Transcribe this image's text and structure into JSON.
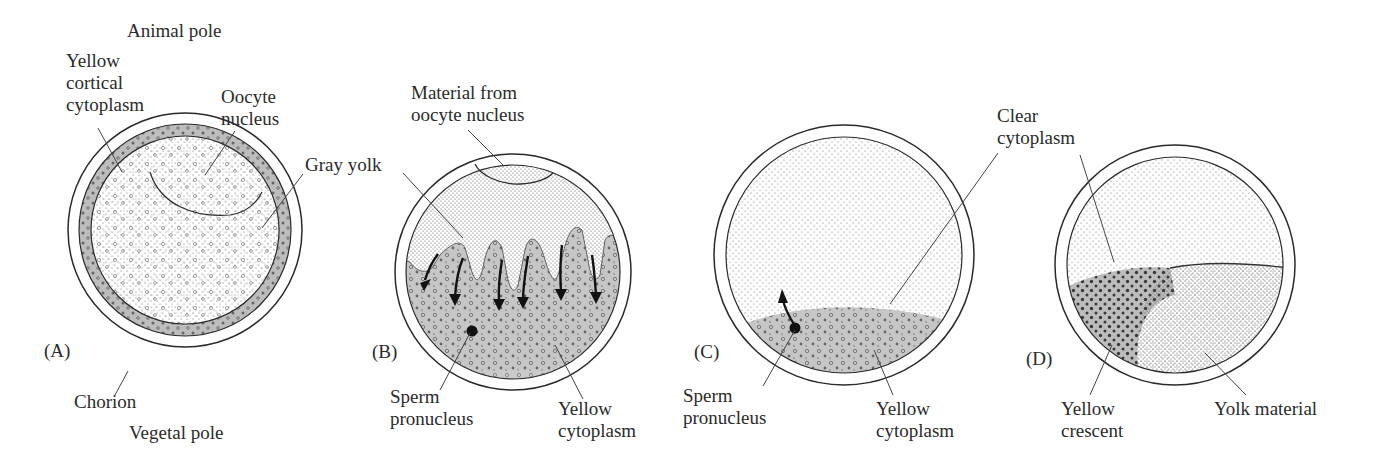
{
  "figure": {
    "poles": {
      "top": "Animal pole",
      "bottom": "Vegetal pole"
    },
    "panels": [
      {
        "id": "A",
        "tag": "(A)",
        "labels": {
          "yellow_cortical": "Yellow cortical cytoplasm",
          "yellow_cortical_lines": [
            "Yellow",
            "cortical",
            "cytoplasm"
          ],
          "oocyte_nucleus_lines": [
            "Oocyte",
            "nucleus"
          ],
          "gray_yolk": "Gray yolk",
          "chorion": "Chorion"
        }
      },
      {
        "id": "B",
        "tag": "(B)",
        "labels": {
          "material_lines": [
            "Material from",
            "oocyte nucleus"
          ],
          "sperm_lines": [
            "Sperm",
            "pronucleus"
          ],
          "yellow_cyto_lines": [
            "Yellow",
            "cytoplasm"
          ]
        }
      },
      {
        "id": "C",
        "tag": "(C)",
        "labels": {
          "clear_lines": [
            "Clear",
            "cytoplasm"
          ],
          "sperm_lines": [
            "Sperm",
            "pronucleus"
          ],
          "yellow_cyto_lines": [
            "Yellow",
            "cytoplasm"
          ]
        }
      },
      {
        "id": "D",
        "tag": "(D)",
        "labels": {
          "yellow_crescent_lines": [
            "Yellow",
            "crescent"
          ],
          "yolk_material": "Yolk material"
        }
      }
    ],
    "colors": {
      "outline": "#2a2a2a",
      "cortical_gray": "#b9b9b9",
      "stipple": "#555555",
      "yellow_region": "#c4c4c4",
      "background": "#ffffff"
    }
  }
}
